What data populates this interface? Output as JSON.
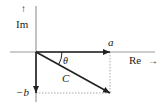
{
  "diagram": {
    "axes": {
      "imaginary": {
        "label": "Im",
        "arrow": "↑"
      },
      "real": {
        "label": "Re",
        "arrow": "→"
      }
    },
    "vectors": [
      {
        "name": "real-component",
        "label": "a"
      },
      {
        "name": "imaginary-component",
        "label": "−b"
      },
      {
        "name": "resultant",
        "label": "C"
      }
    ],
    "angle": {
      "label": "θ"
    },
    "colors": {
      "axis": "#999999",
      "vector": "#222222",
      "dotted": "#aaaaaa",
      "text": "#222222"
    }
  }
}
